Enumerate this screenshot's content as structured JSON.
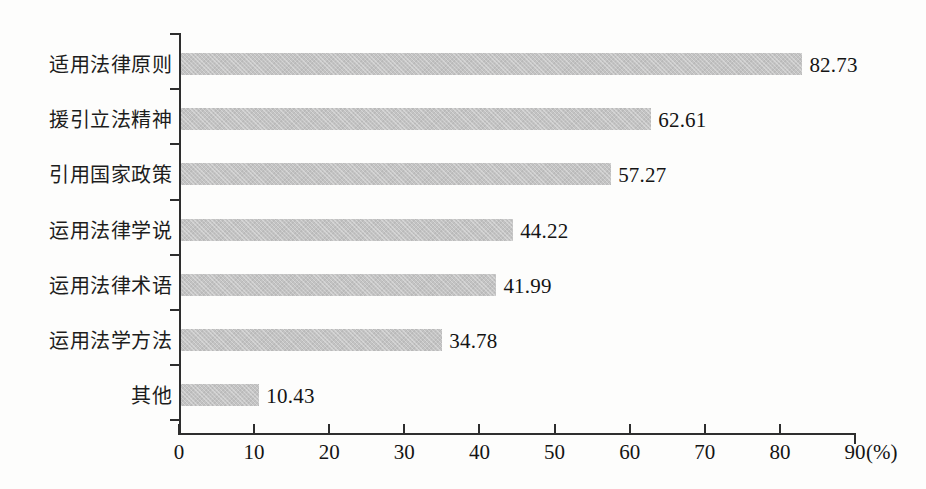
{
  "chart_data": {
    "type": "bar",
    "orientation": "horizontal",
    "title": "",
    "subtitle": "",
    "xlabel": "(%)",
    "ylabel": "",
    "categories": [
      "适用法律原则",
      "援引立法精神",
      "引用国家政策",
      "运用法律学说",
      "运用法律术语",
      "运用法学方法",
      "其他"
    ],
    "values": [
      82.73,
      62.61,
      57.27,
      44.22,
      41.99,
      34.78,
      10.43
    ],
    "value_labels": [
      "82.73",
      "62.61",
      "57.27",
      "44.22",
      "41.99",
      "34.78",
      "10.43"
    ],
    "xlim": [
      0,
      90
    ],
    "xticks": [
      0,
      10,
      20,
      30,
      40,
      50,
      60,
      70,
      80,
      90
    ],
    "xtick_labels": [
      "0",
      "10",
      "20",
      "30",
      "40",
      "50",
      "60",
      "70",
      "80",
      "90"
    ],
    "unit": "(%)",
    "grid": false,
    "legend": null,
    "bar_color": "#c3c3c3",
    "axis_color": "#2e2e2e",
    "text_color": "#141414",
    "background": "#fdfdfc"
  }
}
